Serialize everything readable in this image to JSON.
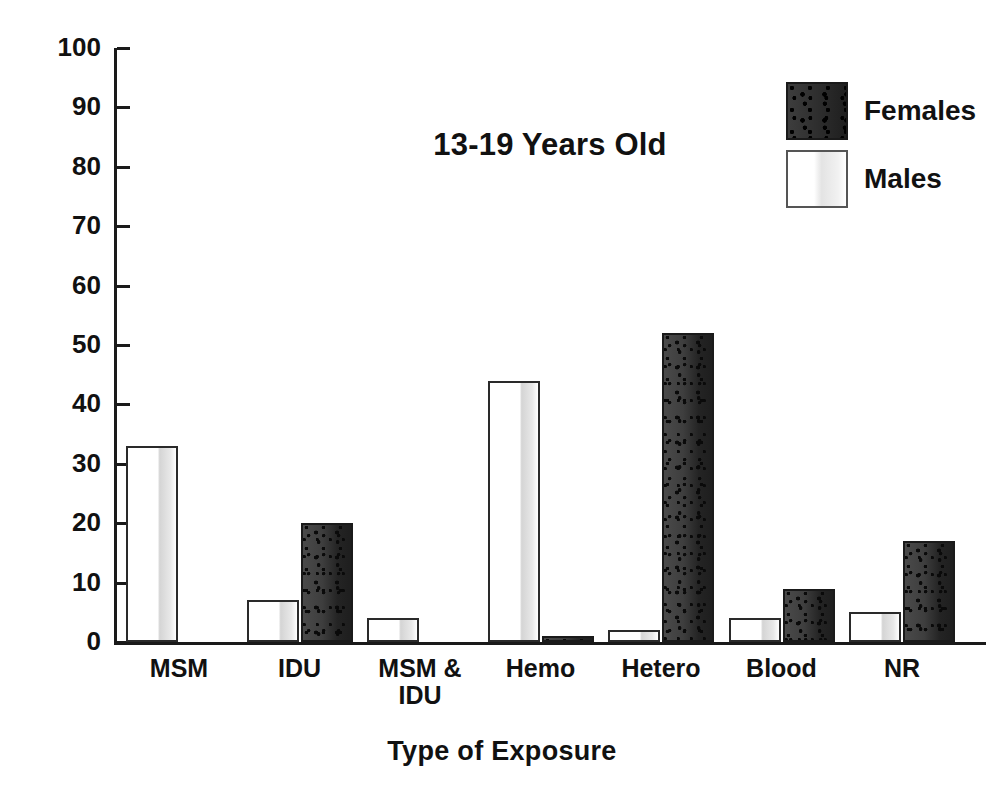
{
  "chart_data": {
    "type": "bar",
    "title": "13-19 Years Old",
    "xlabel": "Type of Exposure",
    "ylabel": "Percentage",
    "ylim": [
      0,
      100
    ],
    "ytick_step": 10,
    "yticks": [
      0,
      10,
      20,
      30,
      40,
      50,
      60,
      70,
      80,
      90,
      100
    ],
    "grid": false,
    "legend_position": "top-right",
    "categories": [
      "MSM",
      "IDU",
      "MSM &\nIDU",
      "Hemo",
      "Hetero",
      "Blood",
      "NR"
    ],
    "series": [
      {
        "name": "Males",
        "color": "#ffffff",
        "values": [
          33,
          7,
          4,
          44,
          2,
          4,
          5
        ]
      },
      {
        "name": "Females",
        "color": "#2a2a2a",
        "values": [
          0,
          20,
          0,
          1,
          52,
          9,
          17
        ]
      }
    ]
  },
  "legend": {
    "items": [
      {
        "label": "Females",
        "swatch": "female"
      },
      {
        "label": "Males",
        "swatch": "male"
      }
    ]
  }
}
